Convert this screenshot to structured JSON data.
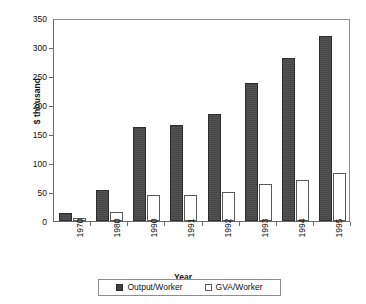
{
  "chart_data": {
    "type": "bar",
    "title": "",
    "xlabel": "Year",
    "ylabel": "$ thousand",
    "ylim": [
      0,
      350
    ],
    "yticks": [
      0,
      50,
      100,
      150,
      200,
      250,
      300,
      350
    ],
    "grid": false,
    "legend_position": "bottom",
    "categories": [
      "1970",
      "1980",
      "1990",
      "1991",
      "1992",
      "1993",
      "1994",
      "1995"
    ],
    "series": [
      {
        "name": "Output/Worker",
        "color": "#4a4a4a",
        "values": [
          14,
          53,
          162,
          165,
          184,
          238,
          281,
          319
        ]
      },
      {
        "name": "GVA/Worker",
        "color": "#ffffff",
        "values": [
          6,
          16,
          45,
          45,
          50,
          64,
          70,
          83
        ]
      }
    ]
  },
  "legend": {
    "items": [
      {
        "label": "Output/Worker",
        "swatch": "filled-dark-square-icon"
      },
      {
        "label": "GVA/Worker",
        "swatch": "outlined-white-square-icon"
      }
    ]
  }
}
